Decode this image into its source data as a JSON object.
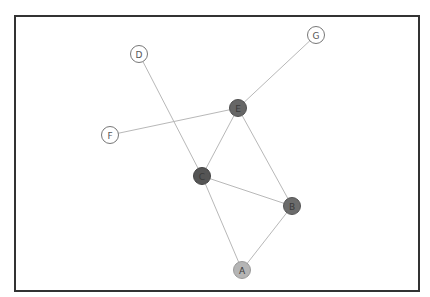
{
  "diagram": {
    "type": "undirected-graph",
    "frame": {
      "x": 15,
      "y": 16,
      "width": 404,
      "height": 275,
      "stroke": "#333333"
    },
    "edge_color": "#b8b8b8",
    "nodes": [
      {
        "id": "A",
        "label": "A",
        "x": 242,
        "y": 270,
        "fill": "#b5b5b5",
        "stroke": "#9a9a9a"
      },
      {
        "id": "B",
        "label": "B",
        "x": 292,
        "y": 206,
        "fill": "#6c6c6c",
        "stroke": "#555555"
      },
      {
        "id": "C",
        "label": "C",
        "x": 202,
        "y": 176,
        "fill": "#555555",
        "stroke": "#444444"
      },
      {
        "id": "D",
        "label": "D",
        "x": 139,
        "y": 54,
        "fill": "#ffffff",
        "stroke": "#777777"
      },
      {
        "id": "E",
        "label": "E",
        "x": 238,
        "y": 108,
        "fill": "#666666",
        "stroke": "#505050"
      },
      {
        "id": "F",
        "label": "F",
        "x": 110,
        "y": 135,
        "fill": "#ffffff",
        "stroke": "#777777"
      },
      {
        "id": "G",
        "label": "G",
        "x": 316,
        "y": 35,
        "fill": "#ffffff",
        "stroke": "#777777"
      }
    ],
    "edges": [
      [
        "A",
        "C"
      ],
      [
        "A",
        "B"
      ],
      [
        "B",
        "C"
      ],
      [
        "B",
        "E"
      ],
      [
        "C",
        "E"
      ],
      [
        "C",
        "D"
      ],
      [
        "E",
        "F"
      ],
      [
        "E",
        "G"
      ]
    ]
  }
}
